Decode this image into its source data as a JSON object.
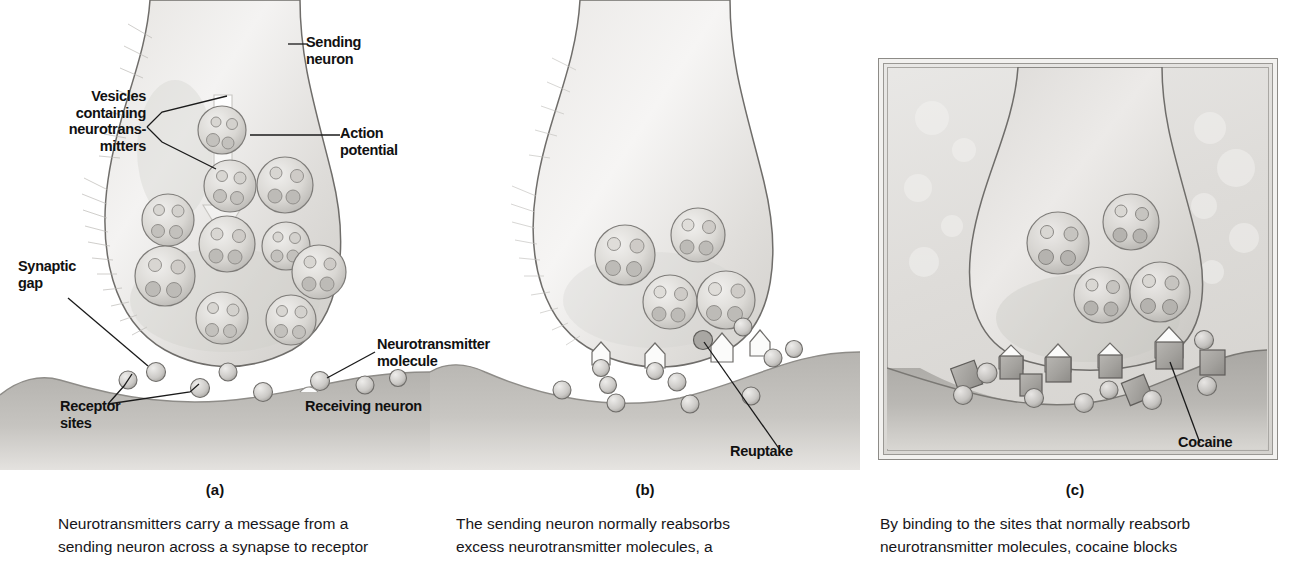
{
  "panels": [
    {
      "id": "a",
      "letter": "(a)",
      "caption_lines": [
        "Neurotransmitters carry a message from a",
        "sending neuron across a synapse to receptor"
      ],
      "labels": [
        {
          "name": "sending-neuron",
          "text": "Sending\nneuron"
        },
        {
          "name": "action-potential",
          "text": "Action\npotential"
        },
        {
          "name": "vesicles-containing-neurotransmitters",
          "text": "Vesicles\ncontaining\nneurotrans-\nmitters"
        },
        {
          "name": "synaptic-gap",
          "text": "Synaptic\ngap"
        },
        {
          "name": "receptor-sites",
          "text": "Receptor\nsites"
        },
        {
          "name": "neurotransmitter-molecule",
          "text": "Neurotransmitter\nmolecule"
        },
        {
          "name": "receiving-neuron",
          "text": "Receiving neuron"
        }
      ]
    },
    {
      "id": "b",
      "letter": "(b)",
      "caption_lines": [
        "The sending neuron normally reabsorbs",
        "excess neurotransmitter molecules, a"
      ],
      "labels": [
        {
          "name": "reuptake",
          "text": "Reuptake"
        }
      ]
    },
    {
      "id": "c",
      "letter": "(c)",
      "caption_lines": [
        "By binding to the sites that normally reabsorb",
        "neurotransmitter molecules, cocaine blocks"
      ],
      "labels": [
        {
          "name": "cocaine",
          "text": "Cocaine"
        }
      ]
    }
  ],
  "colors": {
    "ink": "#111111",
    "leader_line": "#1a1a1a",
    "cytoplasm_light": "#f3f2f1",
    "cytoplasm_mid": "#d9d7d4",
    "membrane_outline": "#6b6967",
    "vesicle_fill": "#dcdad7",
    "vesicle_outline": "#7e7c79",
    "molecule_fill": "#c9c7c4",
    "molecule_outline": "#6f6d6a",
    "receiving_neuron": "#b9b7b3",
    "cocaine_fill": "#a9a7a3",
    "panel_c_bg": "#e3e1de",
    "page_bg": "#ffffff"
  }
}
